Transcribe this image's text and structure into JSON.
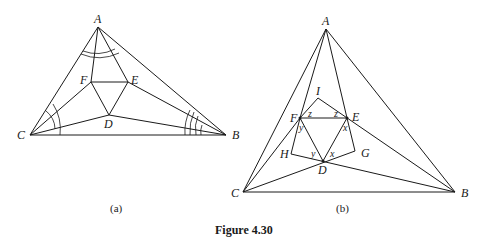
{
  "figure": {
    "title": "Figure 4.30"
  },
  "panel_a": {
    "caption": "(a)",
    "points": {
      "A": {
        "label": "A",
        "x": 98,
        "y": 27
      },
      "B": {
        "label": "B",
        "x": 226,
        "y": 135
      },
      "C": {
        "label": "C",
        "x": 30,
        "y": 135
      },
      "D": {
        "label": "D",
        "x": 109,
        "y": 115
      },
      "E": {
        "label": "E",
        "x": 128,
        "y": 82
      },
      "F": {
        "label": "F",
        "x": 91,
        "y": 82
      }
    }
  },
  "panel_b": {
    "caption": "(b)",
    "points": {
      "A": {
        "label": "A",
        "x": 326,
        "y": 29
      },
      "B": {
        "label": "B",
        "x": 455,
        "y": 192
      },
      "C": {
        "label": "C",
        "x": 243,
        "y": 192
      },
      "D": {
        "label": "D",
        "x": 323,
        "y": 161
      },
      "E": {
        "label": "E",
        "x": 347,
        "y": 118
      },
      "F": {
        "label": "F",
        "x": 300,
        "y": 118
      },
      "G": {
        "label": "G",
        "x": 355,
        "y": 151
      },
      "H": {
        "label": "H",
        "x": 291,
        "y": 154
      },
      "I": {
        "label": "I",
        "x": 318,
        "y": 98
      }
    },
    "angle_labels": {
      "z1": "z",
      "z2": "z",
      "y1": "y",
      "y2": "y",
      "x1": "x",
      "x2": "x"
    }
  }
}
